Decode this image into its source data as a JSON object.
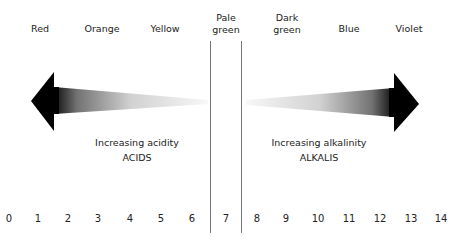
{
  "diagram": {
    "color_labels": [
      {
        "text": "Red",
        "x": 40,
        "y": 23
      },
      {
        "text": "Orange",
        "x": 102,
        "y": 23
      },
      {
        "text": "Yellow",
        "x": 165,
        "y": 23
      },
      {
        "text": "Pale\ngreen",
        "x": 226,
        "y": 12
      },
      {
        "text": "Dark\ngreen",
        "x": 287,
        "y": 12
      },
      {
        "text": "Blue",
        "x": 349,
        "y": 23
      },
      {
        "text": "Violet",
        "x": 409,
        "y": 23
      }
    ],
    "acid_caption": {
      "line1": "Increasing acidity",
      "line2": "ACIDS"
    },
    "alkali_caption": {
      "line1": "Increasing alkalinity",
      "line2": "ALKALIS"
    },
    "ph_scale": [
      "0",
      "1",
      "2",
      "3",
      "4",
      "5",
      "6",
      "7",
      "8",
      "9",
      "10",
      "11",
      "12",
      "13",
      "14"
    ],
    "ph_positions": [
      9,
      38,
      68,
      98,
      130,
      161,
      192,
      226,
      257,
      286,
      318,
      349,
      380,
      411,
      441
    ],
    "neutral_band": {
      "left_x": 210,
      "right_x": 241
    },
    "arrow_color": "#000000"
  }
}
